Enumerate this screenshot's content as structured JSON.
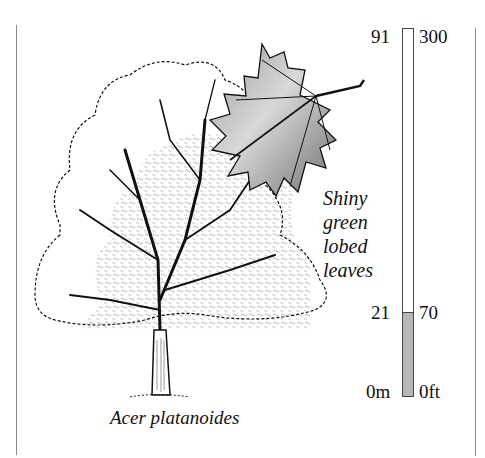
{
  "illustration": {
    "subject": "tree-and-leaf",
    "tree_icon": "deciduous-tree-icon",
    "leaf_icon": "maple-leaf-icon"
  },
  "caption": {
    "species": "Acer platanoides"
  },
  "leaf_note": {
    "lines": [
      "Shiny",
      "green",
      "lobed",
      "leaves"
    ]
  },
  "height_scale": {
    "left_unit_labels": {
      "top": "91",
      "mark": "21",
      "bottom": "0m"
    },
    "right_unit_labels": {
      "top": "300",
      "mark": "70",
      "bottom": "0ft"
    },
    "max_m": 91,
    "max_ft": 300,
    "tree_height_m": 21,
    "tree_height_ft": 70,
    "fill_color": "#b5b5b5",
    "outline_color": "#444444"
  },
  "colors": {
    "background": "#ffffff",
    "ink": "#111111",
    "rule": "#8a8a8a"
  }
}
